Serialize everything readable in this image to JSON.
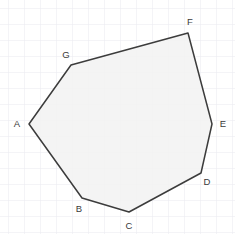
{
  "figure": {
    "type": "geometry-diagram",
    "width": 235,
    "height": 234,
    "background_color": "#ffffff"
  },
  "grid": {
    "visible": true,
    "spacing": 16,
    "offset_x": 8,
    "offset_y": 8,
    "minor_color": "#ededf2",
    "major_color": "#e2e2ea",
    "major_every": 1,
    "line_width": 1
  },
  "polygon": {
    "name": "heptagon-ABCDEFG",
    "vertex_count": 7,
    "fill_color": "#f2f2f2",
    "fill_opacity": 0.85,
    "stroke_color": "#3c3c3c",
    "stroke_width": 1.5,
    "closed": true,
    "vertices": [
      {
        "label": "A",
        "x": 29,
        "y": 124,
        "label_x": 17,
        "label_y": 124,
        "anchor": "middle"
      },
      {
        "label": "B",
        "x": 82,
        "y": 198,
        "label_x": 79,
        "label_y": 209,
        "anchor": "middle"
      },
      {
        "label": "C",
        "x": 129,
        "y": 212,
        "label_x": 129,
        "label_y": 226,
        "anchor": "middle"
      },
      {
        "label": "D",
        "x": 201,
        "y": 173,
        "label_x": 207,
        "label_y": 182,
        "anchor": "middle"
      },
      {
        "label": "E",
        "x": 212,
        "y": 124,
        "label_x": 223,
        "label_y": 124,
        "anchor": "middle"
      },
      {
        "label": "F",
        "x": 188,
        "y": 33,
        "label_x": 190,
        "label_y": 22,
        "anchor": "middle"
      },
      {
        "label": "G",
        "x": 71,
        "y": 65,
        "label_x": 66,
        "label_y": 55,
        "anchor": "middle"
      }
    ],
    "edges": [
      {
        "from": "A",
        "to": "B"
      },
      {
        "from": "B",
        "to": "C"
      },
      {
        "from": "C",
        "to": "D"
      },
      {
        "from": "D",
        "to": "E"
      },
      {
        "from": "E",
        "to": "F"
      },
      {
        "from": "F",
        "to": "G"
      },
      {
        "from": "G",
        "to": "A"
      }
    ]
  },
  "labels": {
    "font_size": 9.5,
    "color": "#3a3a3a"
  }
}
